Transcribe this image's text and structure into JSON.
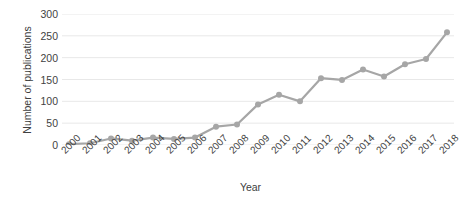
{
  "chart_data": {
    "type": "line",
    "title": "",
    "xlabel": "Year",
    "ylabel": "Number of publications",
    "categories": [
      "2000",
      "2001",
      "2002",
      "2003",
      "2004",
      "2005",
      "2006",
      "2007",
      "2008",
      "2009",
      "2010",
      "2011",
      "2012",
      "2013",
      "2014",
      "2015",
      "2016",
      "2017",
      "2018"
    ],
    "values": [
      2,
      4,
      15,
      10,
      17,
      14,
      17,
      42,
      47,
      93,
      115,
      100,
      153,
      149,
      173,
      157,
      185,
      197,
      258
    ],
    "series": [
      {
        "name": "Number of publications",
        "values": [
          2,
          4,
          15,
          10,
          17,
          14,
          17,
          42,
          47,
          93,
          115,
          100,
          153,
          149,
          173,
          157,
          185,
          197,
          258
        ]
      }
    ],
    "ylim": [
      0,
      300
    ],
    "yticks": [
      0,
      50,
      100,
      150,
      200,
      250,
      300
    ],
    "ytick_labels": [
      "0",
      "50",
      "100",
      "150",
      "200",
      "250",
      "300"
    ],
    "xtick_labels": [
      "2000",
      "2001",
      "2002",
      "2003",
      "2004",
      "2005",
      "2006",
      "2007",
      "2008",
      "2009",
      "2010",
      "2011",
      "2012",
      "2013",
      "2014",
      "2015",
      "2016",
      "2017",
      "2018"
    ],
    "grid": "horizontal",
    "legend": "none",
    "line_color": "#a6a6a6",
    "marker_color": "#a6a6a6",
    "marker_shape": "circle",
    "grid_color": "#e8e8e8",
    "text_color": "#3f3f3f",
    "background": "#ffffff"
  }
}
